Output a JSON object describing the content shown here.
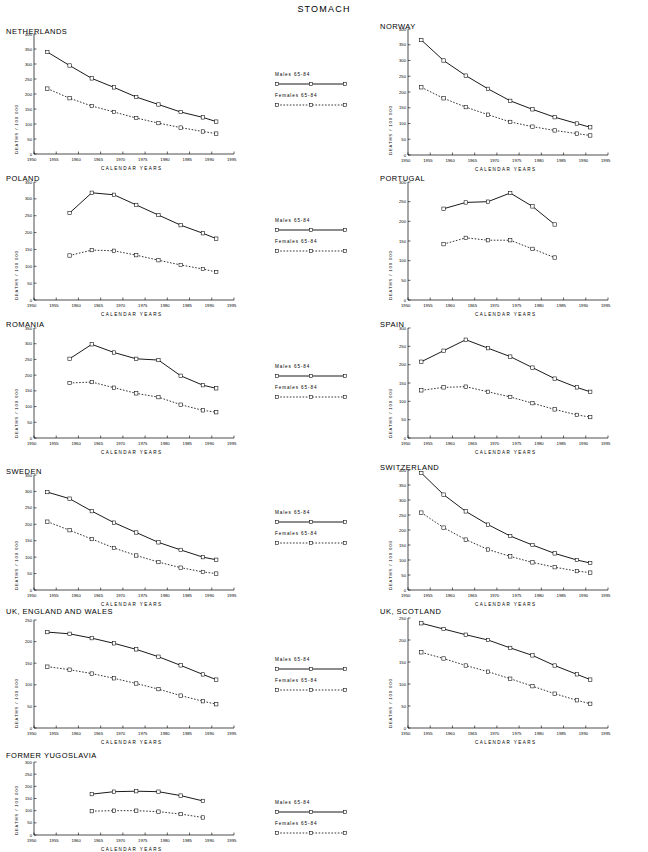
{
  "page": {
    "title": "STOMACH"
  },
  "legend": {
    "males_label": "Males  65-84",
    "females_label": "Females  65-84"
  },
  "axis": {
    "ylabel": "DEATHS / 100 000",
    "xlabel": "CALENDAR  YEARS"
  },
  "chart_data": [
    {
      "type": "line",
      "title": "NETHERLANDS",
      "xlabel": "CALENDAR  YEARS",
      "ylabel": "DEATHS / 100 000",
      "xlim": [
        1950,
        1995
      ],
      "ylim": [
        0,
        400
      ],
      "xticks": [
        1950,
        1955,
        1960,
        1965,
        1970,
        1975,
        1980,
        1985,
        1990,
        1995
      ],
      "yticks": [
        0,
        50,
        100,
        150,
        200,
        250,
        300,
        350,
        400
      ],
      "x": [
        1953,
        1958,
        1963,
        1968,
        1973,
        1978,
        1983,
        1988,
        1991
      ],
      "series": [
        {
          "name": "Males  65-84",
          "values": [
            340,
            295,
            252,
            222,
            190,
            165,
            140,
            122,
            108
          ]
        },
        {
          "name": "Females  65-84",
          "values": [
            218,
            186,
            160,
            140,
            120,
            103,
            88,
            75,
            68
          ]
        }
      ]
    },
    {
      "type": "line",
      "title": "NORWAY",
      "xlabel": "CALENDAR  YEARS",
      "ylabel": "DEATHS / 100 000",
      "xlim": [
        1950,
        1995
      ],
      "ylim": [
        0,
        400
      ],
      "xticks": [
        1950,
        1955,
        1960,
        1965,
        1970,
        1975,
        1980,
        1985,
        1990,
        1995
      ],
      "yticks": [
        0,
        50,
        100,
        150,
        200,
        250,
        300,
        350,
        400
      ],
      "x": [
        1953,
        1958,
        1963,
        1968,
        1973,
        1978,
        1983,
        1988,
        1991
      ],
      "series": [
        {
          "name": "Males  65-84",
          "values": [
            365,
            300,
            252,
            210,
            172,
            145,
            120,
            100,
            88
          ]
        },
        {
          "name": "Females  65-84",
          "values": [
            215,
            180,
            152,
            128,
            105,
            90,
            78,
            68,
            62
          ]
        }
      ]
    },
    {
      "type": "line",
      "title": "POLAND",
      "xlabel": "CALENDAR  YEARS",
      "ylabel": "DEATHS / 100 000",
      "xlim": [
        1950,
        1995
      ],
      "ylim": [
        0,
        350
      ],
      "xticks": [
        1950,
        1955,
        1960,
        1965,
        1970,
        1975,
        1980,
        1985,
        1990,
        1995
      ],
      "yticks": [
        0,
        50,
        100,
        150,
        200,
        250,
        300,
        350
      ],
      "x": [
        1958,
        1963,
        1968,
        1973,
        1978,
        1983,
        1988,
        1991
      ],
      "series": [
        {
          "name": "Males  65-84",
          "values": [
            258,
            318,
            312,
            282,
            252,
            222,
            198,
            182
          ]
        },
        {
          "name": "Females  65-84",
          "values": [
            132,
            148,
            146,
            133,
            118,
            104,
            92,
            83
          ]
        }
      ]
    },
    {
      "type": "line",
      "title": "PORTUGAL",
      "xlabel": "CALENDAR  YEARS",
      "ylabel": "DEATHS / 100 000",
      "xlim": [
        1950,
        1995
      ],
      "ylim": [
        0,
        300
      ],
      "xticks": [
        1950,
        1955,
        1960,
        1965,
        1970,
        1975,
        1980,
        1985,
        1990,
        1995
      ],
      "yticks": [
        0,
        50,
        100,
        150,
        200,
        250,
        300
      ],
      "x": [
        1958,
        1963,
        1968,
        1973,
        1978,
        1983
      ],
      "series": [
        {
          "name": "Males  65-84",
          "values": [
            232,
            248,
            250,
            272,
            238,
            192
          ]
        },
        {
          "name": "Females  65-84",
          "values": [
            142,
            158,
            152,
            152,
            130,
            108
          ]
        }
      ]
    },
    {
      "type": "line",
      "title": "ROMANIA",
      "xlabel": "CALENDAR  YEARS",
      "ylabel": "DEATHS / 100 000",
      "xlim": [
        1950,
        1995
      ],
      "ylim": [
        0,
        350
      ],
      "xticks": [
        1950,
        1955,
        1960,
        1965,
        1970,
        1975,
        1980,
        1985,
        1990,
        1995
      ],
      "yticks": [
        0,
        50,
        100,
        150,
        200,
        250,
        300,
        350
      ],
      "x": [
        1958,
        1963,
        1968,
        1973,
        1978,
        1983,
        1988,
        1991
      ],
      "series": [
        {
          "name": "Males  65-84",
          "values": [
            252,
            298,
            272,
            252,
            248,
            198,
            168,
            158
          ]
        },
        {
          "name": "Females  65-84",
          "values": [
            175,
            178,
            160,
            142,
            130,
            106,
            88,
            82
          ]
        }
      ]
    },
    {
      "type": "line",
      "title": "SPAIN",
      "xlabel": "CALENDAR  YEARS",
      "ylabel": "DEATHS / 100 000",
      "xlim": [
        1950,
        1995
      ],
      "ylim": [
        0,
        300
      ],
      "xticks": [
        1950,
        1955,
        1960,
        1965,
        1970,
        1975,
        1980,
        1985,
        1990,
        1995
      ],
      "yticks": [
        0,
        50,
        100,
        150,
        200,
        250,
        300
      ],
      "x": [
        1953,
        1958,
        1963,
        1968,
        1973,
        1978,
        1983,
        1988,
        1991
      ],
      "series": [
        {
          "name": "Males  65-84",
          "values": [
            208,
            238,
            268,
            245,
            222,
            192,
            162,
            138,
            126
          ]
        },
        {
          "name": "Females  65-84",
          "values": [
            130,
            138,
            140,
            126,
            112,
            95,
            78,
            63,
            57
          ]
        }
      ]
    },
    {
      "type": "line",
      "title": "SWEDEN",
      "xlabel": "CALENDAR  YEARS",
      "ylabel": "DEATHS / 100 000",
      "xlim": [
        1950,
        1995
      ],
      "ylim": [
        0,
        350
      ],
      "xticks": [
        1950,
        1955,
        1960,
        1965,
        1970,
        1975,
        1980,
        1985,
        1990,
        1995
      ],
      "yticks": [
        0,
        50,
        100,
        150,
        200,
        250,
        300,
        350
      ],
      "x": [
        1953,
        1958,
        1963,
        1968,
        1973,
        1978,
        1983,
        1988,
        1991
      ],
      "series": [
        {
          "name": "Males  65-84",
          "values": [
            298,
            278,
            240,
            205,
            175,
            145,
            122,
            100,
            92
          ]
        },
        {
          "name": "Females  65-84",
          "values": [
            208,
            182,
            155,
            128,
            105,
            85,
            68,
            55,
            50
          ]
        }
      ]
    },
    {
      "type": "line",
      "title": "SWITZERLAND",
      "xlabel": "CALENDAR  YEARS",
      "ylabel": "DEATHS / 100 000",
      "xlim": [
        1950,
        1995
      ],
      "ylim": [
        0,
        400
      ],
      "xticks": [
        1950,
        1955,
        1960,
        1965,
        1970,
        1975,
        1980,
        1985,
        1990,
        1995
      ],
      "yticks": [
        0,
        50,
        100,
        150,
        200,
        250,
        300,
        350,
        400
      ],
      "x": [
        1953,
        1958,
        1963,
        1968,
        1973,
        1978,
        1983,
        1988,
        1991
      ],
      "series": [
        {
          "name": "Males  65-84",
          "values": [
            390,
            318,
            262,
            218,
            180,
            150,
            122,
            100,
            90
          ]
        },
        {
          "name": "Females  65-84",
          "values": [
            258,
            208,
            168,
            135,
            112,
            92,
            76,
            63,
            58
          ]
        }
      ]
    },
    {
      "type": "line",
      "title": "UK, ENGLAND AND WALES",
      "xlabel": "CALENDAR  YEARS",
      "ylabel": "DEATHS / 100 000",
      "xlim": [
        1950,
        1995
      ],
      "ylim": [
        0,
        250
      ],
      "xticks": [
        1950,
        1955,
        1960,
        1965,
        1970,
        1975,
        1980,
        1985,
        1990,
        1995
      ],
      "yticks": [
        0,
        50,
        100,
        150,
        200,
        250
      ],
      "x": [
        1953,
        1958,
        1963,
        1968,
        1973,
        1978,
        1983,
        1988,
        1991
      ],
      "series": [
        {
          "name": "Males  65-84",
          "values": [
            222,
            218,
            208,
            196,
            182,
            165,
            145,
            124,
            112
          ]
        },
        {
          "name": "Females  65-84",
          "values": [
            142,
            135,
            126,
            115,
            103,
            90,
            75,
            62,
            55
          ]
        }
      ]
    },
    {
      "type": "line",
      "title": "UK, SCOTLAND",
      "xlabel": "CALENDAR  YEARS",
      "ylabel": "DEATHS / 100 000",
      "xlim": [
        1950,
        1995
      ],
      "ylim": [
        0,
        250
      ],
      "xticks": [
        1950,
        1955,
        1960,
        1965,
        1970,
        1975,
        1980,
        1985,
        1990,
        1995
      ],
      "yticks": [
        0,
        50,
        100,
        150,
        200,
        250
      ],
      "x": [
        1953,
        1958,
        1963,
        1968,
        1973,
        1978,
        1983,
        1988,
        1991
      ],
      "series": [
        {
          "name": "Males  65-84",
          "values": [
            238,
            225,
            212,
            200,
            182,
            165,
            142,
            122,
            110
          ]
        },
        {
          "name": "Females  65-84",
          "values": [
            172,
            158,
            142,
            128,
            112,
            95,
            78,
            63,
            55
          ]
        }
      ]
    },
    {
      "type": "line",
      "title": "FORMER YUGOSLAVIA",
      "xlabel": "CALENDAR  YEARS",
      "ylabel": "DEATHS / 100 000",
      "xlim": [
        1950,
        1995
      ],
      "ylim": [
        0,
        300
      ],
      "xticks": [
        1950,
        1955,
        1960,
        1965,
        1970,
        1975,
        1980,
        1985,
        1990,
        1995
      ],
      "yticks": [
        0,
        50,
        100,
        150,
        200,
        250,
        300
      ],
      "x": [
        1963,
        1968,
        1973,
        1978,
        1983,
        1988
      ],
      "series": [
        {
          "name": "Males  65-84",
          "values": [
            168,
            178,
            180,
            178,
            162,
            140
          ]
        },
        {
          "name": "Females  65-84",
          "values": [
            98,
            100,
            100,
            96,
            86,
            72
          ]
        }
      ]
    }
  ]
}
